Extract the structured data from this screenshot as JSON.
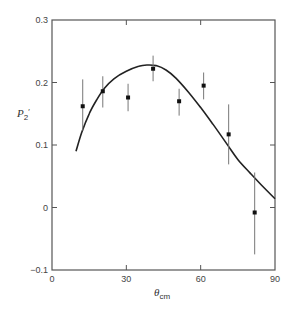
{
  "chart_data": {
    "type": "scatter",
    "title": "",
    "xlabel": "θ_cm",
    "ylabel": "P2'",
    "xlim": [
      0,
      90
    ],
    "ylim": [
      -0.1,
      0.3
    ],
    "x_ticks": [
      0,
      30,
      60,
      90
    ],
    "x_tick_labels": [
      "0",
      "30",
      "60",
      "90"
    ],
    "y_ticks": [
      -0.1,
      0,
      0.1,
      0.2,
      0.3
    ],
    "y_tick_labels": [
      "−0.1",
      "0",
      "0.1",
      "0.2",
      "0.3"
    ],
    "grid": false,
    "legend": null,
    "ticks_inward_all_sides": true,
    "series": [
      {
        "name": "measurements",
        "kind": "points_with_error_bars",
        "points": [
          {
            "x": 12.4,
            "y": 0.162,
            "y_low": 0.123,
            "y_high": 0.205
          },
          {
            "x": 20.5,
            "y": 0.186,
            "y_low": 0.16,
            "y_high": 0.21
          },
          {
            "x": 30.7,
            "y": 0.176,
            "y_low": 0.154,
            "y_high": 0.198
          },
          {
            "x": 40.8,
            "y": 0.222,
            "y_low": 0.202,
            "y_high": 0.243
          },
          {
            "x": 51.3,
            "y": 0.17,
            "y_low": 0.147,
            "y_high": 0.19
          },
          {
            "x": 61.2,
            "y": 0.195,
            "y_low": 0.173,
            "y_high": 0.216
          },
          {
            "x": 71.3,
            "y": 0.117,
            "y_low": 0.069,
            "y_high": 0.165
          },
          {
            "x": 81.8,
            "y": -0.008,
            "y_low": -0.075,
            "y_high": 0.056
          }
        ]
      },
      {
        "name": "theory curve",
        "kind": "line",
        "points": [
          {
            "x": 9.7,
            "y": 0.09
          },
          {
            "x": 12,
            "y": 0.12
          },
          {
            "x": 15,
            "y": 0.15
          },
          {
            "x": 18,
            "y": 0.172
          },
          {
            "x": 21,
            "y": 0.19
          },
          {
            "x": 25,
            "y": 0.206
          },
          {
            "x": 30,
            "y": 0.218
          },
          {
            "x": 35,
            "y": 0.226
          },
          {
            "x": 38.3,
            "y": 0.228
          },
          {
            "x": 42,
            "y": 0.227
          },
          {
            "x": 46,
            "y": 0.22
          },
          {
            "x": 50,
            "y": 0.207
          },
          {
            "x": 55,
            "y": 0.185
          },
          {
            "x": 60,
            "y": 0.16
          },
          {
            "x": 65,
            "y": 0.133
          },
          {
            "x": 70,
            "y": 0.105
          },
          {
            "x": 75,
            "y": 0.077
          },
          {
            "x": 80,
            "y": 0.055
          },
          {
            "x": 85,
            "y": 0.034
          },
          {
            "x": 90,
            "y": 0.014
          }
        ]
      }
    ]
  },
  "labels": {
    "y_axis_main": "P",
    "y_axis_sub": "2",
    "y_axis_prime": "′",
    "x_axis_main": "θ",
    "x_axis_sub": "cm"
  },
  "colors": {
    "axis": "#555555",
    "curve": "#222222",
    "points": "#111111",
    "error_bars": "#777777"
  }
}
